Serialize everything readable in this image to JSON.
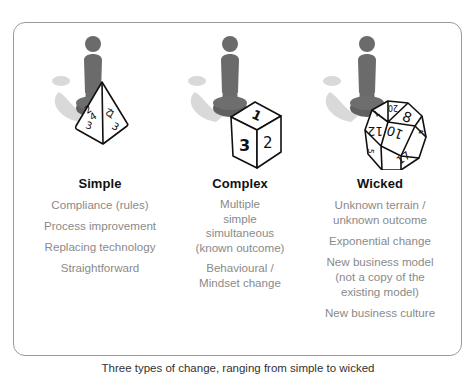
{
  "frame": {
    "border_color": "#9a9a9a",
    "figure_color": "#6b6b6b",
    "shadow_color": "#d6d6d6",
    "title_color": "#111111",
    "item_color": "#8a8a8a"
  },
  "columns": [
    {
      "title": "Simple",
      "icon": "d4-tetrahedron-die-icon",
      "die_faces": [
        "2",
        "4",
        "3",
        "1",
        "2",
        "3"
      ],
      "items": [
        "Compliance (rules)",
        "Process improvement",
        "Replacing technology",
        "Straightforward"
      ]
    },
    {
      "title": "Complex",
      "icon": "d6-cube-die-icon",
      "die_faces": [
        "1",
        "3",
        "2"
      ],
      "items": [
        "Multiple\nsimple\nsimultaneous\n(known outcome)",
        "Behavioural /\nMindset change"
      ]
    },
    {
      "title": "Wicked",
      "icon": "d20-icosahedron-die-icon",
      "die_faces": [
        "20",
        "8",
        "10",
        "12",
        "17",
        "7",
        "4",
        "5"
      ],
      "items": [
        "Unknown terrain /\nunknown outcome",
        "Exponential change",
        "New business model\n(not a copy of the\nexisting model)",
        "New business culture"
      ]
    }
  ],
  "caption": "Three types of change, ranging from simple to wicked"
}
